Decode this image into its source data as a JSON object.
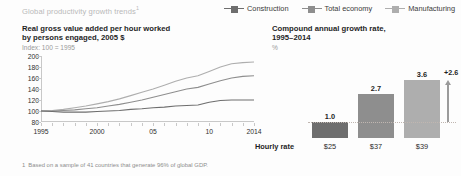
{
  "header": {
    "exhibit_title": "Global productivity growth trends",
    "exhibit_title_footnote_mark": "1"
  },
  "legend": {
    "items": [
      {
        "label": "Construction",
        "color": "#6e6e6e",
        "icon": "legend-line-square-marker"
      },
      {
        "label": "Total economy",
        "color": "#8e8e8e",
        "icon": "legend-line-square-marker"
      },
      {
        "label": "Manufacturing",
        "color": "#aeaeae",
        "icon": "legend-line-square-marker"
      }
    ]
  },
  "left_panel": {
    "title_line1": "Real gross value added per hour worked",
    "title_line2": "by persons engaged, 2005 $",
    "subtitle": "Index: 100 = 1995"
  },
  "right_panel": {
    "title_line1": "Compound annual growth rate,",
    "title_line2": "1995–2014",
    "subtitle": "%"
  },
  "hourly_rate": {
    "label": "Hourly rate",
    "values": [
      "$25",
      "$37",
      "$39"
    ]
  },
  "footnote": {
    "mark": "1",
    "text": "Based on a sample of 41 countries that generate 96% of global GDP."
  },
  "chart_data": [
    {
      "type": "line",
      "id": "productivity-index-line-chart",
      "title": "Real gross value added per hour worked by persons engaged, 2005 $",
      "subtitle": "Index: 100 = 1995",
      "xlabel": "",
      "ylabel": "",
      "ylim": [
        80,
        200
      ],
      "yticks": [
        200,
        180,
        160,
        140,
        120,
        100,
        80
      ],
      "xlim": [
        1995,
        2014
      ],
      "xticks": [
        1995,
        2000,
        2005,
        2010,
        2014
      ],
      "xticklabels": [
        "1995",
        "2000",
        "05",
        "10",
        "2014"
      ],
      "grid": false,
      "legend_position": "top-right",
      "x": [
        1995,
        1996,
        1997,
        1998,
        1999,
        2000,
        2001,
        2002,
        2003,
        2004,
        2005,
        2006,
        2007,
        2008,
        2009,
        2010,
        2011,
        2012,
        2013,
        2014
      ],
      "series": [
        {
          "name": "Manufacturing",
          "color": "#aeaeae",
          "values": [
            100,
            101,
            103,
            106,
            109,
            113,
            117,
            122,
            128,
            134,
            140,
            147,
            154,
            160,
            164,
            172,
            180,
            186,
            188,
            189
          ]
        },
        {
          "name": "Total economy",
          "color": "#8e8e8e",
          "values": [
            100,
            100,
            101,
            102,
            104,
            106,
            109,
            112,
            116,
            120,
            125,
            130,
            135,
            140,
            143,
            149,
            155,
            160,
            163,
            164
          ]
        },
        {
          "name": "Construction",
          "color": "#6e6e6e",
          "values": [
            100,
            99,
            98,
            98,
            98,
            99,
            100,
            101,
            103,
            104,
            106,
            107,
            109,
            110,
            111,
            116,
            119,
            120,
            120,
            120
          ]
        }
      ]
    },
    {
      "type": "bar",
      "id": "cagr-bar-chart",
      "title": "Compound annual growth rate, 1995–2014",
      "subtitle": "%",
      "xlabel": "",
      "ylabel": "%",
      "ylim": [
        0,
        4.2
      ],
      "grid": false,
      "categories": [
        "Construction",
        "Total economy",
        "Manufacturing"
      ],
      "values": [
        1.0,
        2.7,
        3.6
      ],
      "value_labels": [
        "1.0",
        "2.7",
        "3.6"
      ],
      "colors": [
        "#6e6e6e",
        "#8e8e8e",
        "#aeaeae"
      ],
      "annotation": "+2.6",
      "annotation_type": "gap-arrow",
      "reference_line_value": 1.0,
      "secondary_row": {
        "label": "Hourly rate",
        "values": [
          "$25",
          "$37",
          "$39"
        ]
      }
    }
  ]
}
